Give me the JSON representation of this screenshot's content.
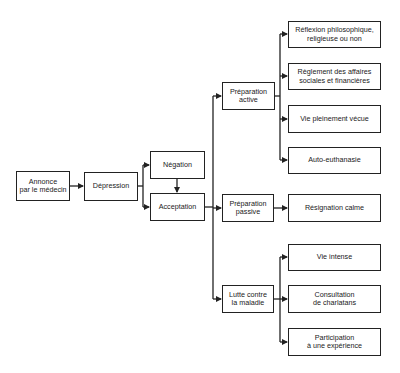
{
  "diagram": {
    "nodes": {
      "annonce": "Annonce\npar le médecin",
      "depression": "Dépression",
      "negation": "Négation",
      "acceptation": "Acceptation",
      "prep_active": "Préparation\nactive",
      "prep_passive": "Préparation\npassive",
      "lutte": "Lutte contre\nla maladie",
      "reflexion": "Réflexion philosophique,\nreligieuse ou non",
      "reglement": "Règlement des affaires\nsociales et financières",
      "vie_pleine": "Vie pleinement vécue",
      "auto_euth": "Auto-euthanasie",
      "resignation": "Résignation calme",
      "vie_intense": "Vie intense",
      "consultation": "Consultation\nde charlatans",
      "participation": "Participation\nà une expérience"
    },
    "edges": [
      [
        "annonce",
        "depression"
      ],
      [
        "depression",
        "negation"
      ],
      [
        "depression",
        "acceptation"
      ],
      [
        "negation",
        "acceptation"
      ],
      [
        "acceptation",
        "prep_active"
      ],
      [
        "acceptation",
        "prep_passive"
      ],
      [
        "acceptation",
        "lutte"
      ],
      [
        "prep_active",
        "reflexion"
      ],
      [
        "prep_active",
        "reglement"
      ],
      [
        "prep_active",
        "vie_pleine"
      ],
      [
        "prep_active",
        "auto_euth"
      ],
      [
        "prep_passive",
        "resignation"
      ],
      [
        "lutte",
        "vie_intense"
      ],
      [
        "lutte",
        "consultation"
      ],
      [
        "lutte",
        "participation"
      ]
    ],
    "colors": {
      "line": "#222222",
      "background": "#ffffff"
    }
  }
}
